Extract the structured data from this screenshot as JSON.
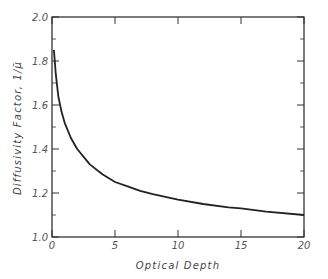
{
  "chart_data": {
    "type": "line",
    "title": "",
    "xlabel": "Optical Depth",
    "ylabel": "Diffusivity Factor, 1/μ̄",
    "xlim": [
      0,
      20
    ],
    "ylim": [
      1.0,
      2.0
    ],
    "x_ticks": [
      0,
      5,
      10,
      15,
      20
    ],
    "x_tick_labels": [
      "0",
      "5",
      "10",
      "15",
      "20"
    ],
    "y_ticks": [
      1.0,
      1.2,
      1.4,
      1.6,
      1.8,
      2.0
    ],
    "y_tick_labels": [
      "1.0",
      "1.2",
      "1.4",
      "1.6",
      "1.8",
      "2.0"
    ],
    "y_minor_ticks": [
      1.1,
      1.3,
      1.5,
      1.7,
      1.9
    ],
    "grid": false,
    "legend": null,
    "series": [
      {
        "name": "Diffusivity Factor",
        "color": "#222222",
        "x": [
          0.15,
          0.3,
          0.5,
          0.75,
          1.0,
          1.5,
          2.0,
          3.0,
          4.0,
          5.0,
          6.0,
          7.0,
          8.0,
          10.0,
          12.0,
          14.0,
          15.0,
          17.0,
          20.0
        ],
        "y": [
          1.85,
          1.74,
          1.64,
          1.57,
          1.52,
          1.45,
          1.4,
          1.33,
          1.285,
          1.25,
          1.23,
          1.21,
          1.195,
          1.17,
          1.15,
          1.135,
          1.13,
          1.115,
          1.1
        ]
      }
    ]
  }
}
